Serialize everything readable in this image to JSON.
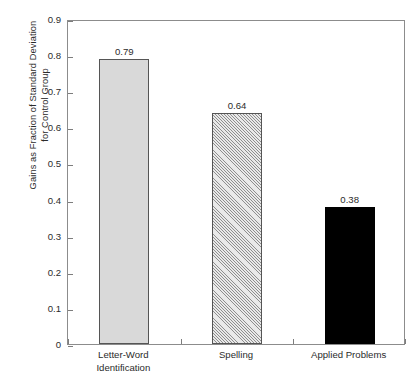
{
  "chart_data": {
    "type": "bar",
    "title": "",
    "subtitle": "",
    "xlabel": "",
    "ylabel": "Gains as Fraction of Standard Deviation for Control Group",
    "ylabel_lines": [
      "Gains as Fraction of Standard Deviation",
      "for Control Group"
    ],
    "categories": [
      "Letter-Word Identification",
      "Spelling",
      "Applied Problems"
    ],
    "category_lines": [
      [
        "Letter-Word",
        "Identification"
      ],
      [
        "Spelling"
      ],
      [
        "Applied Problems"
      ]
    ],
    "values": [
      0.79,
      0.64,
      0.38
    ],
    "value_labels": [
      "0.79",
      "0.64",
      "0.38"
    ],
    "ylim": [
      0,
      0.9
    ],
    "ytick_values": [
      0,
      0.1,
      0.2,
      0.3,
      0.4,
      0.5,
      0.6,
      0.7,
      0.8,
      0.9
    ],
    "ytick_labels": [
      "0",
      "0.1",
      "0.2",
      "0.3",
      "0.4",
      "0.5",
      "0.6",
      "0.7",
      "0.8",
      "0.9"
    ],
    "grid": false,
    "legend": false,
    "legend_position": "none",
    "bar_styles": [
      "solid-light",
      "hatched",
      "solid-black"
    ],
    "bar_colors": [
      "#d9d9d9",
      "#e9e9e9",
      "#000000"
    ],
    "bar_edge_color": "#555555",
    "frame_color": "#8c8c8c",
    "background_color": "#ffffff",
    "text_color": "#2b2b2b"
  }
}
